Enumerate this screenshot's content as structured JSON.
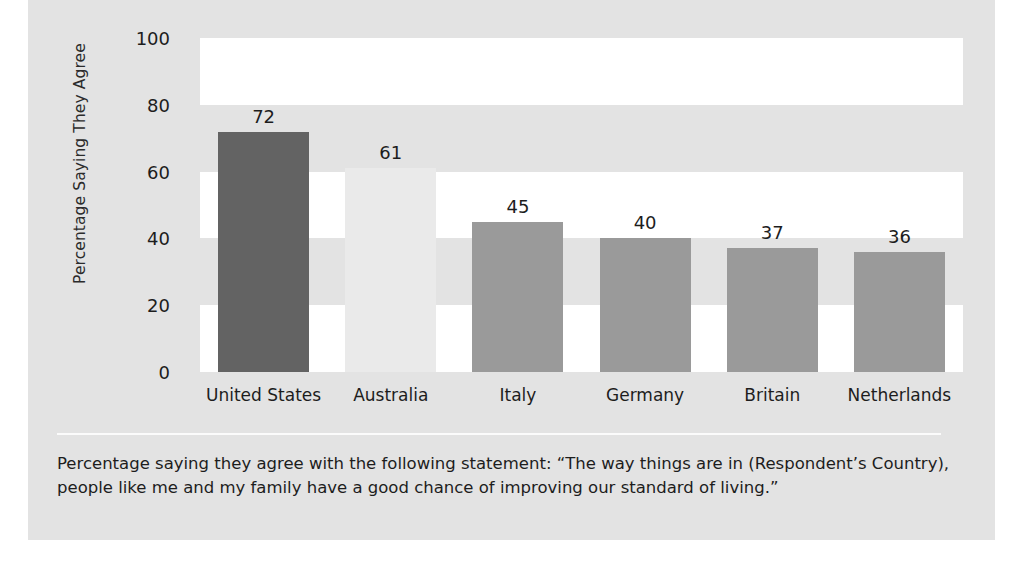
{
  "chart_data": {
    "type": "bar",
    "title": "",
    "subtitle": "",
    "xlabel": "",
    "ylabel": "Percentage Saying They Agree",
    "ylim": [
      0,
      100
    ],
    "ytick_labels": [
      "100",
      "80",
      "60",
      "40",
      "20",
      "0"
    ],
    "yticks": [
      100,
      80,
      60,
      40,
      20,
      0
    ],
    "grid": false,
    "legend": "none",
    "categories": [
      "United States",
      "Australia",
      "Italy",
      "Germany",
      "Britain",
      "Netherlands"
    ],
    "values": [
      72,
      61,
      45,
      40,
      37,
      36
    ],
    "value_labels": [
      "72",
      "61",
      "45",
      "40",
      "37",
      "36"
    ],
    "bar_colors": [
      "#636363",
      "#eaeaea",
      "#9a9a9a",
      "#9a9a9a",
      "#9a9a9a",
      "#9a9a9a"
    ],
    "background_bands": [
      {
        "from": 80,
        "to": 100,
        "color": "#ffffff"
      },
      {
        "from": 60,
        "to": 80,
        "color": "#e3e3e3"
      },
      {
        "from": 40,
        "to": 60,
        "color": "#ffffff"
      },
      {
        "from": 20,
        "to": 40,
        "color": "#e3e3e3"
      },
      {
        "from": 0,
        "to": 20,
        "color": "#ffffff"
      }
    ],
    "annotations": []
  },
  "caption": {
    "text": "Percentage saying they agree with the following statement: “The way things are in (Respondent’s Country), people like me and my family have a good chance of improving our standard of living.”"
  },
  "colors": {
    "panel_background": "#e3e3e3",
    "page_background": "#ffffff",
    "text": "#1d1d1d",
    "divider": "#fbfbfb"
  }
}
